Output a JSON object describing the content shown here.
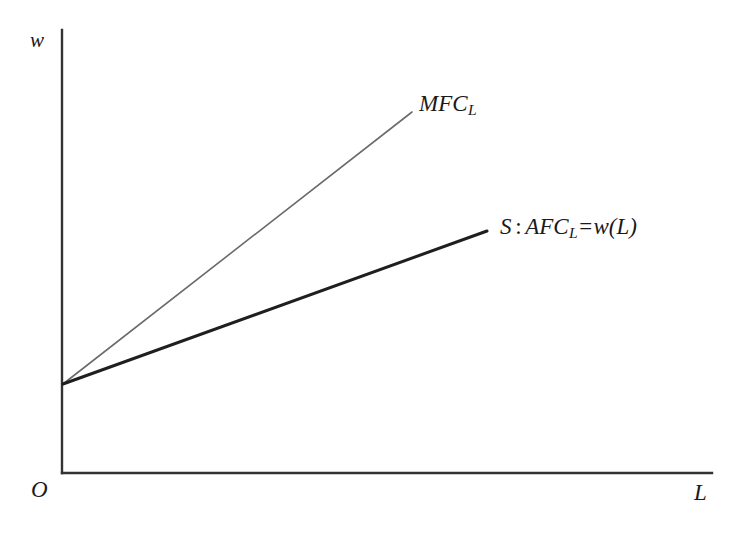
{
  "figure": {
    "background_color": "#ffffff",
    "axes": {
      "y_axis_label": "w",
      "x_axis_label": "L",
      "origin_label": "O",
      "axis_color": "#333333",
      "y_axis": {
        "x": 62,
        "y_top": 30,
        "y_bottom": 473
      },
      "x_axis": {
        "y": 473,
        "x_left": 62,
        "x_right": 712
      }
    },
    "curves": [
      {
        "id": "mfc",
        "label_main": "MFC",
        "label_subscript": "L",
        "color": "#6b6b6b",
        "stroke_width": 1.6,
        "start": {
          "x": 63,
          "y": 384
        },
        "end": {
          "x": 412,
          "y": 112
        },
        "label_position": {
          "x": 419,
          "y": 92
        }
      },
      {
        "id": "supply",
        "label_s": "S",
        "label_colon": ":",
        "label_afc": "AFC",
        "label_subscript": "L",
        "label_equals": "=",
        "label_w": "w",
        "label_paren_open": "(",
        "label_arg": "L",
        "label_paren_close": ")",
        "color": "#1f1f1f",
        "stroke_width": 3.0,
        "start": {
          "x": 63,
          "y": 384
        },
        "end": {
          "x": 487,
          "y": 231
        },
        "label_position": {
          "x": 500,
          "y": 215
        }
      }
    ]
  },
  "chart_data": {
    "type": "line",
    "title": "",
    "xlabel": "L",
    "ylabel": "w",
    "grid": false,
    "legend": "inline-curve-labels",
    "xlim": [
      0,
      1
    ],
    "ylim": [
      0,
      1
    ],
    "origin_label": "O",
    "annotations": [
      {
        "text": "MFC_L",
        "x": 0.55,
        "y": 0.82
      },
      {
        "text": "S : AFC_L=w(L)",
        "x": 0.67,
        "y": 0.55
      }
    ],
    "series": [
      {
        "name": "MFC_L",
        "color": "#6b6b6b",
        "intercept": 0.2,
        "slope": 0.78,
        "x": [
          0,
          0.54
        ],
        "y": [
          0.2,
          0.81
        ]
      },
      {
        "name": "S : AFC_L=w(L)",
        "color": "#1f1f1f",
        "intercept": 0.2,
        "slope": 0.36,
        "x": [
          0,
          0.65
        ],
        "y": [
          0.2,
          0.55
        ]
      }
    ]
  }
}
